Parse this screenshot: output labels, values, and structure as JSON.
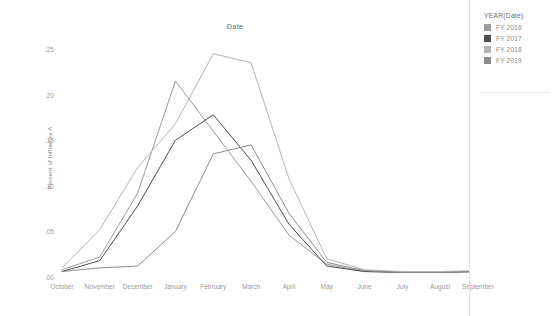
{
  "chart_data": {
    "type": "line",
    "title": "Date",
    "xlabel": "",
    "ylabel": "Percent of Influenza A",
    "categories": [
      "October",
      "November",
      "December",
      "January",
      "February",
      "March",
      "April",
      "May",
      "June",
      "July",
      "August",
      "September"
    ],
    "ytick_labels": [
      ".25",
      ".20",
      ".15",
      ".10",
      ".05",
      ".00"
    ],
    "ytick_values": [
      0.25,
      0.2,
      0.15,
      0.1,
      0.05,
      0.0
    ],
    "ylim": [
      0.0,
      0.26
    ],
    "grid": false,
    "legend_position": "right",
    "legend_title": "YEAR(Date)",
    "series": [
      {
        "name": "FY 2016",
        "color": "#9b9b9b",
        "values": [
          0.008,
          0.022,
          0.092,
          0.215,
          0.16,
          0.105,
          0.046,
          0.014,
          0.006,
          0.005,
          0.005,
          0.006
        ]
      },
      {
        "name": "FY 2017",
        "color": "#4d4d4d",
        "values": [
          0.006,
          0.018,
          0.078,
          0.15,
          0.178,
          0.128,
          0.058,
          0.012,
          0.006,
          0.005,
          0.005,
          0.006
        ]
      },
      {
        "name": "FY 2018",
        "color": "#b4b4b4",
        "values": [
          0.01,
          0.052,
          0.12,
          0.168,
          0.245,
          0.235,
          0.108,
          0.02,
          0.008,
          0.006,
          0.006,
          0.007
        ]
      },
      {
        "name": "FY 2019",
        "color": "#8c8c8c",
        "values": [
          0.006,
          0.01,
          0.012,
          0.05,
          0.135,
          0.145,
          0.07,
          0.016,
          0.007,
          0.005,
          0.005,
          0.006
        ]
      }
    ]
  }
}
